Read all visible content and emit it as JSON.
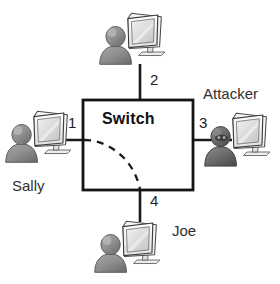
{
  "diagram": {
    "type": "network-topology",
    "title_visible": false,
    "background_color": "#ffffff",
    "line_color": "#1a1a1a",
    "device": {
      "label": "Switch",
      "shape": "rectangle",
      "x": 83,
      "y": 100,
      "width": 110,
      "height": 90,
      "border_color": "#141414",
      "fill_color": "#ffffff"
    },
    "path_overlay": {
      "name": "dashed-traffic-arc",
      "style": "dashed",
      "from_port": "1",
      "to_port": "4",
      "color": "#1a1a1a"
    },
    "ports": [
      {
        "number": "1",
        "side": "left",
        "label_x": 68,
        "label_y": 115,
        "link_from_x": 35,
        "link_from_y": 140,
        "link_to_x": 83,
        "link_to_y": 140
      },
      {
        "number": "2",
        "side": "top",
        "label_x": 150,
        "label_y": 72,
        "link_from_x": 140,
        "link_from_y": 64,
        "link_to_x": 140,
        "link_to_y": 100
      },
      {
        "number": "3",
        "side": "right",
        "label_x": 199,
        "label_y": 115,
        "link_from_x": 193,
        "link_from_y": 140,
        "link_to_x": 232,
        "link_to_y": 140
      },
      {
        "number": "4",
        "side": "bottom",
        "label_x": 150,
        "label_y": 193,
        "link_from_x": 140,
        "link_from_y": 190,
        "link_to_x": 140,
        "link_to_y": 222
      }
    ],
    "hosts": [
      {
        "id": "host-sally",
        "name": "Sally",
        "name_visible": true,
        "name_x": 12,
        "name_y": 178,
        "icon": "user-computer-icon",
        "icon_x": 4,
        "icon_y": 106,
        "person_tone": "light",
        "connected_port": "1"
      },
      {
        "id": "host-top",
        "name": "",
        "name_visible": false,
        "name_x": 0,
        "name_y": 0,
        "icon": "user-computer-icon",
        "icon_x": 98,
        "icon_y": 8,
        "person_tone": "light",
        "connected_port": "2"
      },
      {
        "id": "host-attacker",
        "name": "Attacker",
        "name_visible": true,
        "name_x": 203,
        "name_y": 86,
        "icon": "attacker-computer-icon",
        "icon_x": 203,
        "icon_y": 108,
        "person_tone": "dark",
        "connected_port": "3"
      },
      {
        "id": "host-joe",
        "name": "Joe",
        "name_visible": true,
        "name_x": 172,
        "name_y": 223,
        "icon": "user-computer-icon",
        "icon_x": 93,
        "icon_y": 216,
        "person_tone": "light",
        "connected_port": "4"
      }
    ]
  }
}
